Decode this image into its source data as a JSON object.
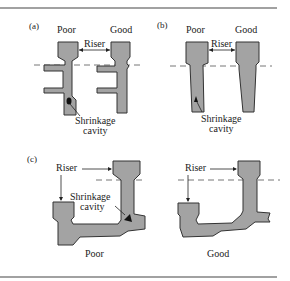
{
  "figure": {
    "panels": [
      {
        "id": "a",
        "label": "(a)",
        "left_caption": "Poor",
        "right_caption": "Good",
        "riser_label": "Riser",
        "defect_label_line1": "Shrinkage",
        "defect_label_line2": "cavity"
      },
      {
        "id": "b",
        "label": "(b)",
        "left_caption": "Poor",
        "right_caption": "Good",
        "riser_label": "Riser",
        "defect_label_line1": "Shrinkage",
        "defect_label_line2": "cavity"
      },
      {
        "id": "c",
        "label": "(c)",
        "left_caption": "Poor",
        "right_caption": "Good",
        "riser_label_left": "Riser",
        "riser_label_right": "Riser",
        "defect_label_line1": "Shrinkage",
        "defect_label_line2": "cavity"
      }
    ],
    "colors": {
      "casting_fill": "#a3a3a3",
      "outline": "#333333",
      "parting_line": "#777777"
    }
  }
}
